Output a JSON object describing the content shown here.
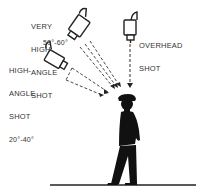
{
  "diagram": {
    "labels": {
      "very_high_angle": {
        "lines": [
          "VERY",
          "HIGH-",
          "ANGLE",
          "SHOT"
        ],
        "angle": "50°-60°"
      },
      "high_angle": {
        "lines": [
          "HIGH-",
          "ANGLE",
          "SHOT"
        ],
        "angle": "20°-40°"
      },
      "overhead": {
        "lines": [
          "OVERHEAD",
          "SHOT"
        ]
      }
    },
    "colors": {
      "ink": "#111111",
      "text": "#333333",
      "background": "#ffffff"
    }
  }
}
